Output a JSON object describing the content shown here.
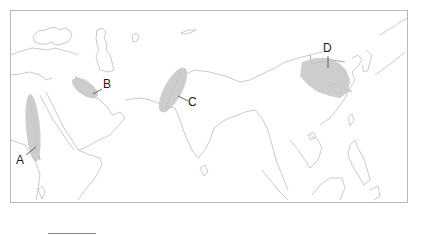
{
  "map": {
    "title": "",
    "colors": {
      "region_fill": "#c8c8c8",
      "coastline": "#c4c4c4",
      "river": "#9a9a9a",
      "frame": "#b8b8b8",
      "label": "#1a1a1a"
    },
    "regions": [
      {
        "id": "A",
        "label": "A",
        "description": "Nile River valley"
      },
      {
        "id": "B",
        "label": "B",
        "description": "Tigris-Euphrates (Mesopotamia)"
      },
      {
        "id": "C",
        "label": "C",
        "description": "Indus River valley"
      },
      {
        "id": "D",
        "label": "D",
        "description": "Huang He (Yellow River) valley"
      }
    ]
  }
}
